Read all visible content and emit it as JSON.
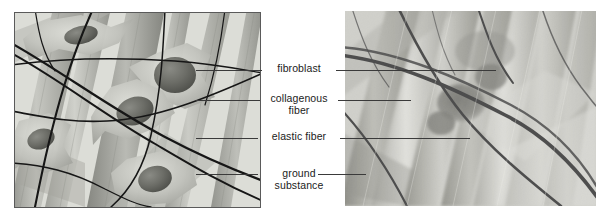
{
  "figure": {
    "background_color": "#ffffff",
    "width": 602,
    "height": 217
  },
  "panels": [
    {
      "id": "illustration-panel",
      "name": "illustration-panel",
      "kind": "drawing",
      "description": "Grayscale schematic drawing of loose connective tissue showing star-shaped fibroblasts, thick banded collagenous fibers, thin dark branching elastic fibers and pale ground substance.",
      "border_color": "#5a5a5a",
      "base_color": "#cfd0cb"
    },
    {
      "id": "micrograph-panel",
      "name": "micrograph-panel",
      "kind": "photomicrograph",
      "description": "Black and white electron micrograph of loose connective tissue with bundles of collagenous fibers, dark elastic fibers and a fibroblast.",
      "border_color": "#9a9a96",
      "base_color": "#b9b9b4"
    }
  ],
  "labels": [
    {
      "id": "fibroblast",
      "text": "fibroblast",
      "lines": [
        "fibroblast"
      ],
      "left_leader": {
        "from_x": 262,
        "from_y": 70,
        "to_x": 196,
        "to_y": 70
      },
      "right_leader": {
        "from_x": 336,
        "from_y": 70,
        "to_x": 496,
        "to_y": 70
      }
    },
    {
      "id": "collagenous-fiber",
      "text": "collagenous fiber",
      "lines": [
        "collagenous",
        "fiber"
      ],
      "left_leader": {
        "from_x": 260,
        "from_y": 100,
        "to_x": 196,
        "to_y": 100
      },
      "right_leader": {
        "from_x": 338,
        "from_y": 100,
        "to_x": 411,
        "to_y": 100
      }
    },
    {
      "id": "elastic-fiber",
      "text": "elastic fiber",
      "lines": [
        "elastic fiber"
      ],
      "left_leader": {
        "from_x": 258,
        "from_y": 138,
        "to_x": 196,
        "to_y": 138
      },
      "right_leader": {
        "from_x": 340,
        "from_y": 138,
        "to_x": 470,
        "to_y": 138
      }
    },
    {
      "id": "ground-substance",
      "text": "ground substance",
      "lines": [
        "ground",
        "substance"
      ],
      "left_leader": {
        "from_x": 258,
        "from_y": 174,
        "to_x": 196,
        "to_y": 174
      },
      "right_leader": {
        "from_x": 318,
        "from_y": 174,
        "to_x": 366,
        "to_y": 174
      }
    }
  ],
  "style": {
    "leader_color": "#3a3a3a",
    "label_color": "#1b1b1b",
    "label_font_size": "10.5px"
  },
  "illustration_features": {
    "fibroblast_count": 5,
    "fibroblast_body_color": "#c3c4bf",
    "fibroblast_nucleus_color": "#6f706c",
    "collagen_fiber_color": "#9a9b95",
    "collagen_fiber_highlight": "#c9cac4",
    "elastic_fiber_color": "#141414",
    "ground_substance_color": "#d9dad5"
  },
  "micrograph_features": {
    "collagen_band_dark": "#6e6e69",
    "collagen_band_light": "#d2d2cd",
    "elastic_fiber_color": "#1a1a1a",
    "fibroblast_blob_color": "#5d5d59"
  }
}
